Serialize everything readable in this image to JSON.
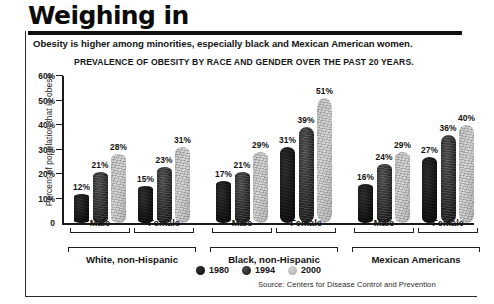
{
  "header": {
    "title": "Weighing in",
    "subtitle": "Obesity is higher among minorities, especially black and Mexican American women."
  },
  "legend": {
    "items": [
      {
        "label": "1980",
        "swatch": "circle-dark-icon",
        "color": "#0f0f0f"
      },
      {
        "label": "1994",
        "swatch": "circle-mid-icon",
        "color": "#1c1c1c"
      },
      {
        "label": "2000",
        "swatch": "circle-light-icon",
        "color": "#c9c9c9"
      }
    ]
  },
  "source": "Source: Centers for Disease Control and Prevention",
  "chart_data": {
    "type": "bar",
    "title": "PREVALENCE OF OBESITY BY RACE AND GENDER OVER THE PAST 20 YEARS.",
    "xlabel": "",
    "ylabel": "Percent of population that is obese",
    "ylim": [
      0,
      60
    ],
    "yticks": [
      "0",
      "10%",
      "20%",
      "30%",
      "40%",
      "50%",
      "60%"
    ],
    "ytick_values": [
      0,
      10,
      20,
      30,
      40,
      50,
      60
    ],
    "grid": false,
    "legend_position": "bottom",
    "categories": [
      "White, non-Hispanic Male",
      "White, non-Hispanic Female",
      "Black, non-Hispanic Male",
      "Black, non-Hispanic Female",
      "Mexican Americans Male",
      "Mexican Americans Female"
    ],
    "groups": [
      {
        "race": "White, non-Hispanic",
        "genders": [
          {
            "gender": "Male",
            "values": [
              12,
              21,
              28
            ],
            "labels": [
              "12%",
              "21%",
              "28%"
            ]
          },
          {
            "gender": "Female",
            "values": [
              15,
              23,
              31
            ],
            "labels": [
              "15%",
              "23%",
              "31%"
            ]
          }
        ]
      },
      {
        "race": "Black, non-Hispanic",
        "genders": [
          {
            "gender": "Male",
            "values": [
              17,
              21,
              29
            ],
            "labels": [
              "17%",
              "21%",
              "29%"
            ]
          },
          {
            "gender": "Female",
            "values": [
              31,
              39,
              51
            ],
            "labels": [
              "31%",
              "39%",
              "51%"
            ]
          }
        ]
      },
      {
        "race": "Mexican Americans",
        "genders": [
          {
            "gender": "Male",
            "values": [
              16,
              24,
              29
            ],
            "labels": [
              "16%",
              "24%",
              "29%"
            ]
          },
          {
            "gender": "Female",
            "values": [
              27,
              36,
              40
            ],
            "labels": [
              "27%",
              "36%",
              "40%"
            ]
          }
        ]
      }
    ],
    "series": [
      {
        "name": "1980",
        "values": [
          12,
          15,
          17,
          31,
          16,
          27
        ]
      },
      {
        "name": "1994",
        "values": [
          21,
          23,
          21,
          39,
          24,
          36
        ]
      },
      {
        "name": "2000",
        "values": [
          28,
          31,
          29,
          51,
          29,
          40
        ]
      }
    ]
  }
}
